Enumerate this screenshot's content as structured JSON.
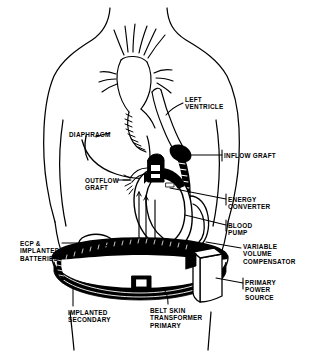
{
  "figure": {
    "style": "black-and-white line art",
    "colors": {
      "ink": "#000000",
      "background": "#ffffff"
    }
  },
  "labels": [
    {
      "id": "left-ventricle",
      "lines": [
        "LEFT",
        "VENTRICLE"
      ],
      "x": 185,
      "y": 96,
      "align": "left"
    },
    {
      "id": "diaphragm",
      "lines": [
        "DIAPHRAGM"
      ],
      "x": 69,
      "y": 131,
      "align": "left"
    },
    {
      "id": "inflow-graft",
      "lines": [
        "INFLOW GRAFT"
      ],
      "x": 224,
      "y": 152,
      "align": "left"
    },
    {
      "id": "outflow-graft",
      "lines": [
        "OUTFLOW",
        "GRAFT"
      ],
      "x": 85,
      "y": 177,
      "align": "left"
    },
    {
      "id": "energy-converter",
      "lines": [
        "ENERGY",
        "CONVERTER"
      ],
      "x": 228,
      "y": 196,
      "align": "left"
    },
    {
      "id": "blood-pump",
      "lines": [
        "BLOOD",
        "PUMP"
      ],
      "x": 228,
      "y": 222,
      "align": "left"
    },
    {
      "id": "variable-volume-compensator",
      "lines": [
        "VARIABLE",
        "VOLUME",
        "COMPENSATOR"
      ],
      "x": 243,
      "y": 243,
      "align": "left"
    },
    {
      "id": "ecp-implanted-batteries",
      "lines": [
        "ECP &",
        "IMPLANTED",
        "BATTERIES"
      ],
      "x": 20,
      "y": 240,
      "align": "left"
    },
    {
      "id": "primary-power-source",
      "lines": [
        "PRIMARY",
        "POWER",
        "SOURCE"
      ],
      "x": 245,
      "y": 279,
      "align": "left"
    },
    {
      "id": "implanted-secondary",
      "lines": [
        "IMPLANTED",
        "SECONDARY"
      ],
      "x": 68,
      "y": 309,
      "align": "left"
    },
    {
      "id": "belt-skin-transformer-primary",
      "lines": [
        "BELT SKIN",
        "TRANSFORMER",
        "PRIMARY"
      ],
      "x": 150,
      "y": 307,
      "align": "left"
    }
  ],
  "anatomy": {
    "torso": "outline of head-less upper body: neck, shoulders, arms, waist",
    "heart": "native heart with aortic arch and branching great vessels",
    "left_ventricle": "apex of left ventricle with cannulation cuff",
    "diaphragm": "curved dome line beneath the heart"
  },
  "device": {
    "blood_pump": "large rounded pump body below the diaphragm",
    "energy_converter": "small boxed module atop the pump",
    "inflow_graft": "dark ribbed conduit from left ventricle apex to pump",
    "outflow_graft": "conduit from pump to aorta",
    "variable_volume_compensator": "compliance chamber at pump right",
    "ecp_implanted_batteries": "rounded implanted module at left abdomen",
    "implanted_secondary": "coil segment on the belt band at left",
    "belt_skin_transformer_primary": "dark belt worn around the waist with square buckle",
    "primary_power_source": "rectangular battery pack box on the right hip"
  }
}
